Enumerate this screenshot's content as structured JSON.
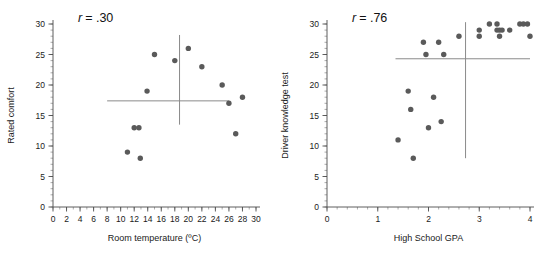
{
  "figure": {
    "background_color": "#ffffff",
    "point_color": "#5a5a5a",
    "axis_color": "#4d4d4d",
    "reference_line_color": "#8a8a8a"
  },
  "chart_data": [
    {
      "type": "scatter",
      "id": "room-temperature-vs-rated-comfort",
      "title": "",
      "annotation": "r = .30",
      "annotation_symbol": "r",
      "annotation_value": "= .30",
      "correlation": 0.3,
      "xlabel": "Room temperature (ºC)",
      "ylabel": "Rated comfort",
      "xlim": [
        0,
        30
      ],
      "ylim": [
        0,
        30
      ],
      "xticks": [
        0,
        2,
        4,
        6,
        8,
        10,
        12,
        14,
        16,
        18,
        20,
        22,
        24,
        26,
        28,
        30
      ],
      "xtick_labels": [
        "0",
        "2",
        "4",
        "6",
        "8",
        "10",
        "12",
        "14",
        "16",
        "18",
        "20",
        "22",
        "24",
        "26",
        "28",
        "30"
      ],
      "yticks": [
        0,
        5,
        10,
        15,
        20,
        25,
        30
      ],
      "ytick_labels": [
        "0",
        "5",
        "10",
        "15",
        "20",
        "25",
        "30"
      ],
      "x_minor_step": 1,
      "y_minor_step": 1,
      "grid": false,
      "legend": "none",
      "mean_line_x": 18.7,
      "mean_line_y": 17.4,
      "mean_line_x_span": [
        8,
        26
      ],
      "mean_line_y_span": [
        13.5,
        28.2
      ],
      "points": [
        {
          "x": 11.0,
          "y": 9
        },
        {
          "x": 12.0,
          "y": 13
        },
        {
          "x": 12.7,
          "y": 13
        },
        {
          "x": 12.9,
          "y": 8
        },
        {
          "x": 13.9,
          "y": 19
        },
        {
          "x": 15.0,
          "y": 25
        },
        {
          "x": 18.0,
          "y": 24
        },
        {
          "x": 20.0,
          "y": 26
        },
        {
          "x": 22.0,
          "y": 23
        },
        {
          "x": 25.0,
          "y": 20
        },
        {
          "x": 26.0,
          "y": 17
        },
        {
          "x": 27.0,
          "y": 12
        },
        {
          "x": 28.0,
          "y": 18
        }
      ]
    },
    {
      "type": "scatter",
      "id": "high-school-gpa-vs-driver-knowledge-test",
      "title": "",
      "annotation": "r = .76",
      "annotation_symbol": "r",
      "annotation_value": "= .76",
      "correlation": 0.76,
      "xlabel": "High School GPA",
      "ylabel": "Driver knowledge test",
      "xlim": [
        0,
        4
      ],
      "ylim": [
        0,
        30
      ],
      "xticks": [
        0,
        1,
        2,
        3,
        4
      ],
      "xtick_labels": [
        "0",
        "1",
        "2",
        "3",
        "4"
      ],
      "yticks": [
        0,
        5,
        10,
        15,
        20,
        25,
        30
      ],
      "ytick_labels": [
        "0",
        "5",
        "10",
        "15",
        "20",
        "25",
        "30"
      ],
      "x_minor_step": 0.2,
      "y_minor_step": 1,
      "grid": false,
      "legend": "none",
      "mean_line_x": 2.73,
      "mean_line_y": 24.3,
      "mean_line_x_span": [
        1.35,
        4.0
      ],
      "mean_line_y_span": [
        8.0,
        30.3
      ],
      "points": [
        {
          "x": 1.4,
          "y": 11
        },
        {
          "x": 1.6,
          "y": 19
        },
        {
          "x": 1.65,
          "y": 16
        },
        {
          "x": 1.7,
          "y": 8
        },
        {
          "x": 1.9,
          "y": 27
        },
        {
          "x": 1.95,
          "y": 25
        },
        {
          "x": 2.0,
          "y": 13
        },
        {
          "x": 2.1,
          "y": 18
        },
        {
          "x": 2.2,
          "y": 27
        },
        {
          "x": 2.25,
          "y": 14
        },
        {
          "x": 2.3,
          "y": 25
        },
        {
          "x": 2.6,
          "y": 28
        },
        {
          "x": 3.0,
          "y": 29
        },
        {
          "x": 3.0,
          "y": 28
        },
        {
          "x": 3.2,
          "y": 30
        },
        {
          "x": 3.35,
          "y": 30
        },
        {
          "x": 3.35,
          "y": 29
        },
        {
          "x": 3.4,
          "y": 29
        },
        {
          "x": 3.4,
          "y": 28
        },
        {
          "x": 3.45,
          "y": 29
        },
        {
          "x": 3.6,
          "y": 29
        },
        {
          "x": 3.8,
          "y": 30
        },
        {
          "x": 3.87,
          "y": 30
        },
        {
          "x": 3.95,
          "y": 30
        },
        {
          "x": 4.0,
          "y": 28
        }
      ]
    }
  ]
}
